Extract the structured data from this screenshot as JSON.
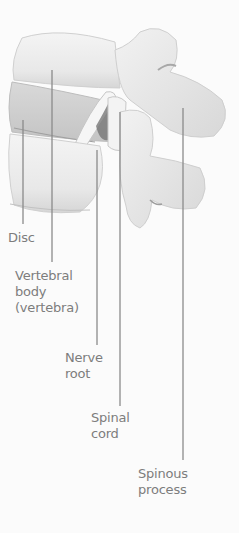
{
  "diagram": {
    "labels": [
      {
        "id": "disc",
        "lines": [
          "Disc"
        ]
      },
      {
        "id": "vertebral-body",
        "lines": [
          "Vertebral",
          "body",
          "(vertebra)"
        ]
      },
      {
        "id": "nerve-root",
        "lines": [
          "Nerve",
          "root"
        ]
      },
      {
        "id": "spinal-cord",
        "lines": [
          "Spinal",
          "cord"
        ]
      },
      {
        "id": "spinous-process",
        "lines": [
          "Spinous",
          "process"
        ]
      }
    ],
    "colors": {
      "label_text": "#7d7d7d",
      "leader_line": "#8a8a8a",
      "bone_fill": "#ededed",
      "bone_shadow": "#c9c9c9",
      "background": "#fbfbfb"
    }
  }
}
